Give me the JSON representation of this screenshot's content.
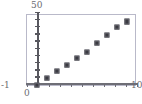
{
  "chart_data": {
    "type": "scatter",
    "title": "",
    "subtitle": "",
    "xlabel": "",
    "ylabel": "",
    "grid": false,
    "legend": null,
    "xlim": [
      -1,
      10
    ],
    "ylim": [
      0,
      50
    ],
    "y_axis_top_label": "50",
    "x_axis_left_label": "-1",
    "x_axis_origin_label": "0",
    "x_axis_right_label": "10",
    "x_tick_count": 11,
    "y_tick_count": 10,
    "marker": "square",
    "marker_color": "#3b3b42",
    "frame_color": "#b9b9c9",
    "axis_color": "#58585f",
    "x": [
      0,
      1,
      2,
      3,
      4,
      5,
      6,
      7,
      8,
      9
    ],
    "y": [
      0,
      5,
      9.5,
      14,
      18.5,
      23,
      29,
      34.5,
      40,
      44
    ]
  },
  "axis_labels": {
    "y_top": "50",
    "x_left": "-1",
    "x_origin": "0",
    "x_right": "10"
  }
}
